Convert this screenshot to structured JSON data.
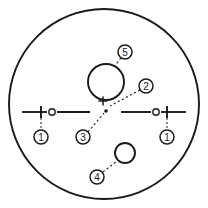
{
  "figure": {
    "type": "technical-line-drawing",
    "background_color": "#ffffff",
    "stroke_color": "#1a1a1a",
    "width": 208,
    "height": 208,
    "boundary": {
      "shape": "circle",
      "cx": 104,
      "cy": 104,
      "r": 95
    },
    "features": [
      {
        "id": "large-bore-circle",
        "shape": "circle",
        "cx": 106,
        "cy": 82,
        "r": 18
      },
      {
        "id": "lower-bore-circle",
        "shape": "circle",
        "cx": 125,
        "cy": 153,
        "r": 10
      },
      {
        "id": "left-small-hole",
        "shape": "circle",
        "cx": 52,
        "cy": 112,
        "r": 3.2
      },
      {
        "id": "right-small-hole",
        "shape": "circle",
        "cx": 156,
        "cy": 112,
        "r": 3.2
      }
    ],
    "axis_lines": [
      {
        "id": "left-axis-line",
        "x1": 22,
        "y1": 112,
        "x2": 47,
        "y2": 112
      },
      {
        "id": "left-axis-line-inner",
        "x1": 57,
        "y1": 112,
        "x2": 90,
        "y2": 112
      },
      {
        "id": "right-axis-line-inner",
        "x1": 121,
        "y1": 112,
        "x2": 151,
        "y2": 112
      },
      {
        "id": "right-axis-line",
        "x1": 161,
        "y1": 112,
        "x2": 186,
        "y2": 112
      }
    ],
    "tick_marks": [
      {
        "id": "left-tick",
        "x1": 41,
        "y1": 106,
        "x2": 41,
        "y2": 118
      },
      {
        "id": "right-tick",
        "x1": 167,
        "y1": 106,
        "x2": 167,
        "y2": 118
      }
    ],
    "center_mark": {
      "id": "center-crosshair",
      "cx": 103,
      "cy": 101,
      "arm": 4.5
    },
    "center_dot": {
      "id": "datum-dot",
      "cx": 106,
      "cy": 111,
      "r": 1.8
    },
    "callouts": [
      {
        "id": "callout-1-left",
        "label": "1",
        "cx": 41,
        "cy": 137,
        "r": 7,
        "leader": {
          "type": "dashed-vertical",
          "x1": 41,
          "y1": 118,
          "x2": 41,
          "y2": 130
        }
      },
      {
        "id": "callout-1-right",
        "label": "1",
        "cx": 167,
        "cy": 137,
        "r": 7,
        "leader": {
          "type": "dashed-vertical",
          "x1": 167,
          "y1": 118,
          "x2": 167,
          "y2": 130
        }
      },
      {
        "id": "callout-2",
        "label": "2",
        "cx": 146,
        "cy": 86,
        "r": 7,
        "leader": {
          "type": "dashed-diagonal",
          "x1": 140,
          "y1": 90,
          "x2": 110,
          "y2": 106
        }
      },
      {
        "id": "callout-3",
        "label": "3",
        "cx": 83,
        "cy": 137,
        "r": 7,
        "leader": {
          "type": "dashed-diagonal",
          "x1": 88,
          "y1": 132,
          "x2": 104,
          "y2": 113
        }
      },
      {
        "id": "callout-4",
        "label": "4",
        "cx": 97,
        "cy": 177,
        "r": 7,
        "leader": {
          "type": "dashed-diagonal",
          "x1": 103,
          "y1": 172,
          "x2": 117,
          "y2": 161
        }
      },
      {
        "id": "callout-5",
        "label": "5",
        "cx": 125,
        "cy": 52,
        "r": 7,
        "leader": {
          "type": "dashed-diagonal",
          "x1": 121,
          "y1": 58,
          "x2": 113,
          "y2": 68
        }
      }
    ]
  }
}
